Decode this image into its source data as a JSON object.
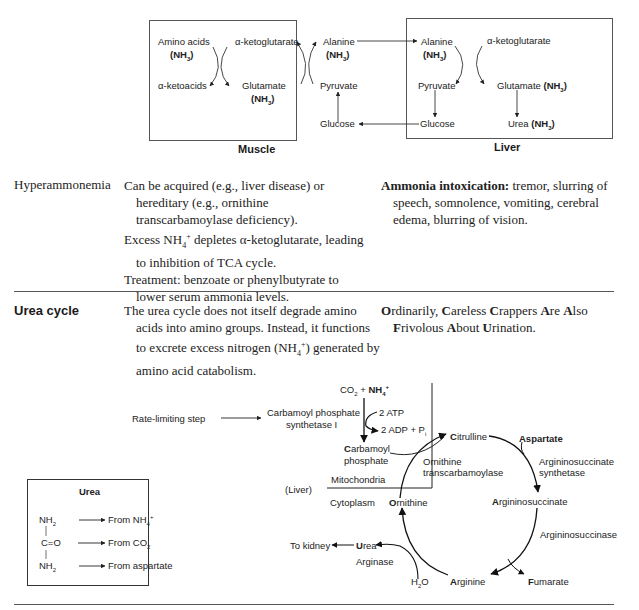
{
  "top_diagram": {
    "muscle": {
      "label": "Muscle",
      "amino_acids": "Amino acids",
      "nh3": "(NH3)",
      "alpha_ketoacids": "α-ketoacids",
      "alpha_ketoglutarate": "α-ketoglutarate",
      "glutamate": "Glutamate",
      "alanine": "Alanine",
      "pyruvate": "Pyruvate",
      "glucose": "Glucose"
    },
    "liver": {
      "label": "Liver",
      "alanine": "Alanine",
      "alpha_ketoglutarate": "α-ketoglutarate",
      "pyruvate": "Pyruvate",
      "glutamate": "Glutamate",
      "glucose": "Glucose",
      "urea": "Urea"
    }
  },
  "hyperammonemia": {
    "term": "Hyperammonemia",
    "lines": [
      "Can be acquired (e.g., liver disease) or hereditary (e.g., ornithine transcarbamoylase deficiency).",
      "Excess NH4+ depletes α-ketoglutarate, leading to inhibition of TCA cycle.",
      "Treatment: benzoate or phenylbutyrate to lower serum ammonia levels."
    ],
    "note_bold": "Ammonia intoxication:",
    "note_text": " tremor, slurring of speech, somnolence, vomiting, cerebral edema, blurring of vision."
  },
  "urea_cycle": {
    "term": "Urea cycle",
    "description": "The urea cycle does not itself degrade amino acids into amino groups. Instead, it functions to excrete excess nitrogen (NH4+) generated by amino acid catabolism.",
    "mnemonic": "Ordinarily, Careless Crappers Are Also Frivolous About Urination."
  },
  "cycle_diagram": {
    "rate_limiting": "Rate-limiting step",
    "cps1_line1": "Carbamoyl phosphate",
    "cps1_line2": "synthetase I",
    "co2": "CO2 + ",
    "nh4": "NH4+",
    "atp": "2 ATP",
    "adp": "2 ADP + Pi",
    "carbamoyl_line1": "Carbamoyl",
    "carbamoyl_line2": "phosphate",
    "citrulline": "Citrulline",
    "aspartate": "Aspartate",
    "otc_line1": "Ornithine",
    "otc_line2": "transcarbamoylase",
    "ass_line1": "Argininosuccinate",
    "ass_line2": "synthetase",
    "mitochondria": "Mitochondria",
    "liver": "(Liver)",
    "cytoplasm": "Cytoplasm",
    "ornithine": "Ornithine",
    "argininosuccinate": "Argininosuccinate",
    "argininosuccinase": "Argininosuccinase",
    "to_kidney": "To kidney",
    "urea": "Urea",
    "arginase": "Arginase",
    "h2o": "H2O",
    "arginine": "Arginine",
    "fumarate": "Fumarate"
  },
  "urea_box": {
    "title": "Urea",
    "rows": [
      {
        "group": "NH2",
        "source": "From NH4+"
      },
      {
        "group": "C=O",
        "source": "From CO2"
      },
      {
        "group": "NH2",
        "source": "From aspartate"
      }
    ]
  }
}
